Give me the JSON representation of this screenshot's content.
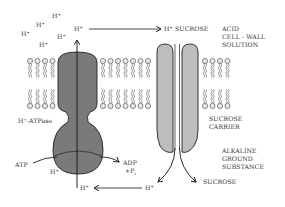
{
  "diagram": {
    "title": "",
    "regions": {
      "outside": [
        "ACID",
        "CELL - WALL",
        "SOLUTION"
      ],
      "inside": [
        "ALKALINE",
        "GROUND",
        "SUBSTANCE"
      ]
    },
    "proteins": {
      "pump": "H⁺-ATPase",
      "carrier_line1": "SUCROSE",
      "carrier_line2": "CARRIER"
    },
    "ions_outside": [
      "H",
      "H",
      "H",
      "H",
      "H",
      "H"
    ],
    "ion_symbol": "H",
    "ion_charge": "+",
    "top_flow": {
      "from": "H",
      "to_label": "SUCROSE"
    },
    "reaction": {
      "input": "ATP",
      "output_line1": "ADP",
      "output_line2": "+P",
      "output_sub": "i"
    },
    "bottom_flow": {
      "ion": "H",
      "sucrose": "SUCROSE"
    },
    "colors": {
      "pump_fill": "#7a7a7a",
      "carrier_fill": "#bdbdbd",
      "lipid_head": "#e6e6e6",
      "stroke": "#222222",
      "text": "#333333"
    }
  }
}
